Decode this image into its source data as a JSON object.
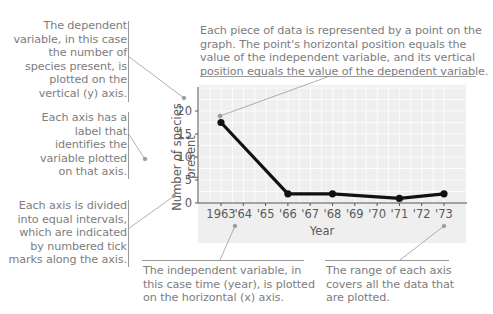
{
  "annotations": {
    "dependent_variable": [
      "The dependent",
      "variable, in this case",
      "the number of",
      "species present, is",
      "plotted on the",
      "vertical (y) axis."
    ],
    "data_point": [
      "Each piece of data is represented by a point on the",
      "graph. The point's horizontal position equals the",
      "value of the independent variable, and its vertical",
      "position equals the value of the dependent variable."
    ],
    "axis_label": [
      "Each axis has a",
      "label that",
      "identifies the",
      "variable plotted",
      "on that axis."
    ],
    "intervals": [
      "Each axis is divided",
      "into equal intervals,",
      "which are indicated",
      "by numbered tick",
      "marks along the axis."
    ],
    "independent_variable": [
      "The independent variable, in",
      "this case time (year), is plotted",
      "on the horizontal (x) axis."
    ],
    "range": [
      "The range of each axis",
      "covers all the data that",
      "are plotted."
    ]
  },
  "chart_data": {
    "type": "line",
    "title": "",
    "xlabel": "Year",
    "ylabel": "Number of species present",
    "x_tick_labels": [
      "1963",
      "'64",
      "'65",
      "'66",
      "'67",
      "'68",
      "'69",
      "'70",
      "'71",
      "'72",
      "'73"
    ],
    "y_tick_labels": [
      "0",
      "5",
      "10",
      "15",
      "20"
    ],
    "ylim": [
      0,
      25
    ],
    "xlim": [
      1963,
      1973
    ],
    "grid": true,
    "series": [
      {
        "name": "Number of species present",
        "x": [
          1963,
          1966,
          1968,
          1971,
          1973
        ],
        "values": [
          17.5,
          2,
          2,
          1,
          2
        ]
      }
    ]
  },
  "colors": {
    "panel": "#efefef",
    "line": "#111111",
    "annotation_text": "#7d7d7d",
    "leader": "#9a9a9a"
  }
}
